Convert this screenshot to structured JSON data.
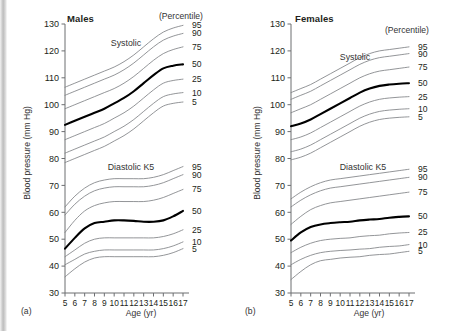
{
  "figure": {
    "panel_a_letter": "(a)",
    "panel_b_letter": "(b)"
  },
  "chart_data": [
    {
      "type": "line",
      "title": "Males",
      "panel": "(a)",
      "xlabel": "Age (yr)",
      "ylabel": "Blood pressure (mm Hg)",
      "legend_title": "(Percentile)",
      "legend_position": "right-outside",
      "grid": false,
      "xlim": [
        5,
        17
      ],
      "ylim": [
        30,
        130
      ],
      "yticks": [
        30,
        40,
        50,
        60,
        70,
        80,
        90,
        100,
        110,
        120,
        130
      ],
      "x": [
        5,
        6,
        7,
        8,
        9,
        10,
        11,
        12,
        13,
        14,
        15,
        16,
        17
      ],
      "group_labels": [
        "Systolic",
        "Diastolic K5"
      ],
      "groups": [
        {
          "name": "Systolic",
          "series": [
            {
              "name": "95",
              "values": [
                106.5,
                108.0,
                109.5,
                111.0,
                112.5,
                114.0,
                116.0,
                118.5,
                121.5,
                124.5,
                127.0,
                128.5,
                129.5
              ]
            },
            {
              "name": "90",
              "values": [
                103.5,
                105.0,
                106.5,
                108.0,
                109.5,
                111.0,
                113.0,
                115.5,
                118.5,
                121.5,
                124.0,
                125.5,
                126.5
              ]
            },
            {
              "name": "75",
              "values": [
                98.5,
                100.0,
                101.5,
                103.0,
                104.5,
                106.0,
                108.0,
                110.5,
                113.5,
                116.5,
                119.0,
                120.5,
                121.5
              ]
            },
            {
              "name": "50",
              "values": [
                92.5,
                94.0,
                95.5,
                97.0,
                98.5,
                100.5,
                102.5,
                105.0,
                108.0,
                111.0,
                113.5,
                114.5,
                115.0
              ]
            },
            {
              "name": "25",
              "values": [
                87.0,
                88.5,
                90.0,
                91.5,
                93.0,
                95.0,
                97.0,
                99.5,
                102.5,
                105.5,
                108.0,
                109.0,
                109.5
              ]
            },
            {
              "name": "10",
              "values": [
                82.0,
                83.5,
                85.0,
                86.5,
                88.0,
                90.0,
                92.0,
                94.5,
                97.5,
                100.5,
                103.0,
                104.0,
                104.5
              ]
            },
            {
              "name": "5",
              "values": [
                78.5,
                80.0,
                81.5,
                83.0,
                84.5,
                86.5,
                88.5,
                91.0,
                94.0,
                97.0,
                99.5,
                100.5,
                101.0
              ]
            }
          ]
        },
        {
          "name": "Diastolic K5",
          "series": [
            {
              "name": "95",
              "values": [
                62.0,
                66.0,
                69.0,
                71.0,
                72.0,
                72.5,
                72.5,
                72.5,
                72.5,
                73.0,
                74.0,
                75.5,
                77.0
              ]
            },
            {
              "name": "90",
              "values": [
                59.0,
                63.0,
                66.0,
                68.0,
                69.0,
                69.5,
                69.5,
                69.5,
                69.5,
                70.0,
                71.0,
                72.5,
                74.0
              ]
            },
            {
              "name": "75",
              "values": [
                52.5,
                57.0,
                60.5,
                62.5,
                63.5,
                64.0,
                64.0,
                64.0,
                64.0,
                64.5,
                65.5,
                67.0,
                68.5
              ]
            },
            {
              "name": "50",
              "values": [
                46.5,
                50.5,
                54.0,
                56.0,
                56.5,
                57.0,
                57.0,
                56.8,
                56.5,
                56.5,
                57.0,
                58.5,
                60.5
              ]
            },
            {
              "name": "25",
              "values": [
                43.5,
                46.0,
                48.5,
                50.0,
                50.5,
                50.5,
                50.5,
                50.5,
                50.5,
                50.5,
                51.0,
                52.0,
                53.5
              ]
            },
            {
              "name": "10",
              "values": [
                40.5,
                42.5,
                44.5,
                45.5,
                46.0,
                46.0,
                46.0,
                46.0,
                46.0,
                46.0,
                46.5,
                47.5,
                49.0
              ]
            },
            {
              "name": "5",
              "values": [
                36.0,
                39.0,
                41.5,
                43.0,
                43.5,
                43.5,
                43.5,
                43.5,
                43.5,
                43.5,
                44.0,
                45.0,
                46.5
              ]
            }
          ]
        }
      ],
      "xticks": [
        "5",
        "6",
        "7",
        "8",
        "9",
        "10",
        "11",
        "12",
        "13",
        "14",
        "15",
        "16",
        "17"
      ],
      "percentiles": [
        "95",
        "90",
        "75",
        "50",
        "25",
        "10",
        "5"
      ]
    },
    {
      "type": "line",
      "title": "Females",
      "panel": "(b)",
      "xlabel": "Age (yr)",
      "ylabel": "Blood pressure (mm Hg)",
      "legend_title": "(Percentile)",
      "legend_position": "right-outside",
      "grid": false,
      "xlim": [
        5,
        17
      ],
      "ylim": [
        30,
        130
      ],
      "yticks": [
        30,
        40,
        50,
        60,
        70,
        80,
        90,
        100,
        110,
        120,
        130
      ],
      "x": [
        5,
        6,
        7,
        8,
        9,
        10,
        11,
        12,
        13,
        14,
        15,
        16,
        17
      ],
      "group_labels": [
        "Systolic",
        "Diastolic K5"
      ],
      "groups": [
        {
          "name": "Systolic",
          "series": [
            {
              "name": "95",
              "values": [
                104.5,
                106.0,
                107.5,
                109.5,
                111.5,
                113.5,
                115.5,
                117.5,
                119.0,
                120.0,
                120.5,
                121.0,
                121.5
              ]
            },
            {
              "name": "90",
              "values": [
                102.0,
                103.5,
                105.0,
                107.0,
                109.0,
                111.0,
                113.0,
                115.0,
                116.5,
                117.5,
                118.0,
                118.5,
                119.0
              ]
            },
            {
              "name": "75",
              "values": [
                97.0,
                98.5,
                100.0,
                102.0,
                104.0,
                106.0,
                108.0,
                110.0,
                111.5,
                112.5,
                113.0,
                113.5,
                114.0
              ]
            },
            {
              "name": "50",
              "values": [
                92.0,
                93.0,
                94.5,
                96.5,
                98.5,
                100.5,
                102.5,
                104.5,
                106.0,
                107.0,
                107.5,
                107.8,
                108.0
              ]
            },
            {
              "name": "25",
              "values": [
                87.0,
                88.0,
                89.5,
                91.5,
                93.5,
                95.5,
                97.5,
                99.5,
                101.0,
                102.0,
                102.5,
                102.8,
                103.0
              ]
            },
            {
              "name": "10",
              "values": [
                82.5,
                83.5,
                85.0,
                87.0,
                89.0,
                91.0,
                93.0,
                95.0,
                96.5,
                97.5,
                98.0,
                98.3,
                98.5
              ]
            },
            {
              "name": "5",
              "values": [
                79.5,
                80.5,
                82.0,
                84.0,
                86.0,
                88.0,
                90.0,
                92.0,
                93.5,
                94.5,
                95.0,
                95.3,
                95.5
              ]
            }
          ]
        },
        {
          "name": "Diastolic K5",
          "series": [
            {
              "name": "95",
              "values": [
                65.0,
                67.5,
                69.5,
                71.0,
                72.0,
                72.5,
                73.0,
                73.5,
                74.0,
                74.5,
                75.0,
                75.5,
                76.0
              ]
            },
            {
              "name": "90",
              "values": [
                62.0,
                64.5,
                66.5,
                68.0,
                69.0,
                69.5,
                70.0,
                70.5,
                71.0,
                71.5,
                72.0,
                72.5,
                73.0
              ]
            },
            {
              "name": "75",
              "values": [
                55.5,
                58.5,
                61.0,
                62.5,
                63.5,
                64.0,
                64.5,
                65.0,
                65.5,
                66.0,
                66.5,
                67.0,
                67.5
              ]
            },
            {
              "name": "50",
              "values": [
                49.5,
                52.5,
                54.5,
                55.5,
                56.0,
                56.3,
                56.5,
                57.0,
                57.3,
                57.5,
                58.0,
                58.3,
                58.5
              ]
            },
            {
              "name": "25",
              "values": [
                45.0,
                47.0,
                48.5,
                49.5,
                50.0,
                50.3,
                50.5,
                51.0,
                51.3,
                51.5,
                52.0,
                52.3,
                52.5
              ]
            },
            {
              "name": "10",
              "values": [
                40.5,
                42.5,
                44.0,
                45.0,
                45.5,
                45.8,
                46.0,
                46.3,
                46.5,
                47.0,
                47.3,
                47.5,
                48.0
              ]
            },
            {
              "name": "5",
              "values": [
                35.0,
                38.0,
                40.5,
                42.0,
                42.5,
                43.0,
                43.3,
                43.5,
                44.0,
                44.3,
                44.5,
                45.0,
                45.5
              ]
            }
          ]
        }
      ],
      "xticks": [
        "5",
        "6",
        "7",
        "8",
        "9",
        "10",
        "11",
        "12",
        "13",
        "14",
        "15",
        "16",
        "17"
      ],
      "percentiles": [
        "95",
        "90",
        "75",
        "50",
        "25",
        "10",
        "5"
      ]
    }
  ]
}
